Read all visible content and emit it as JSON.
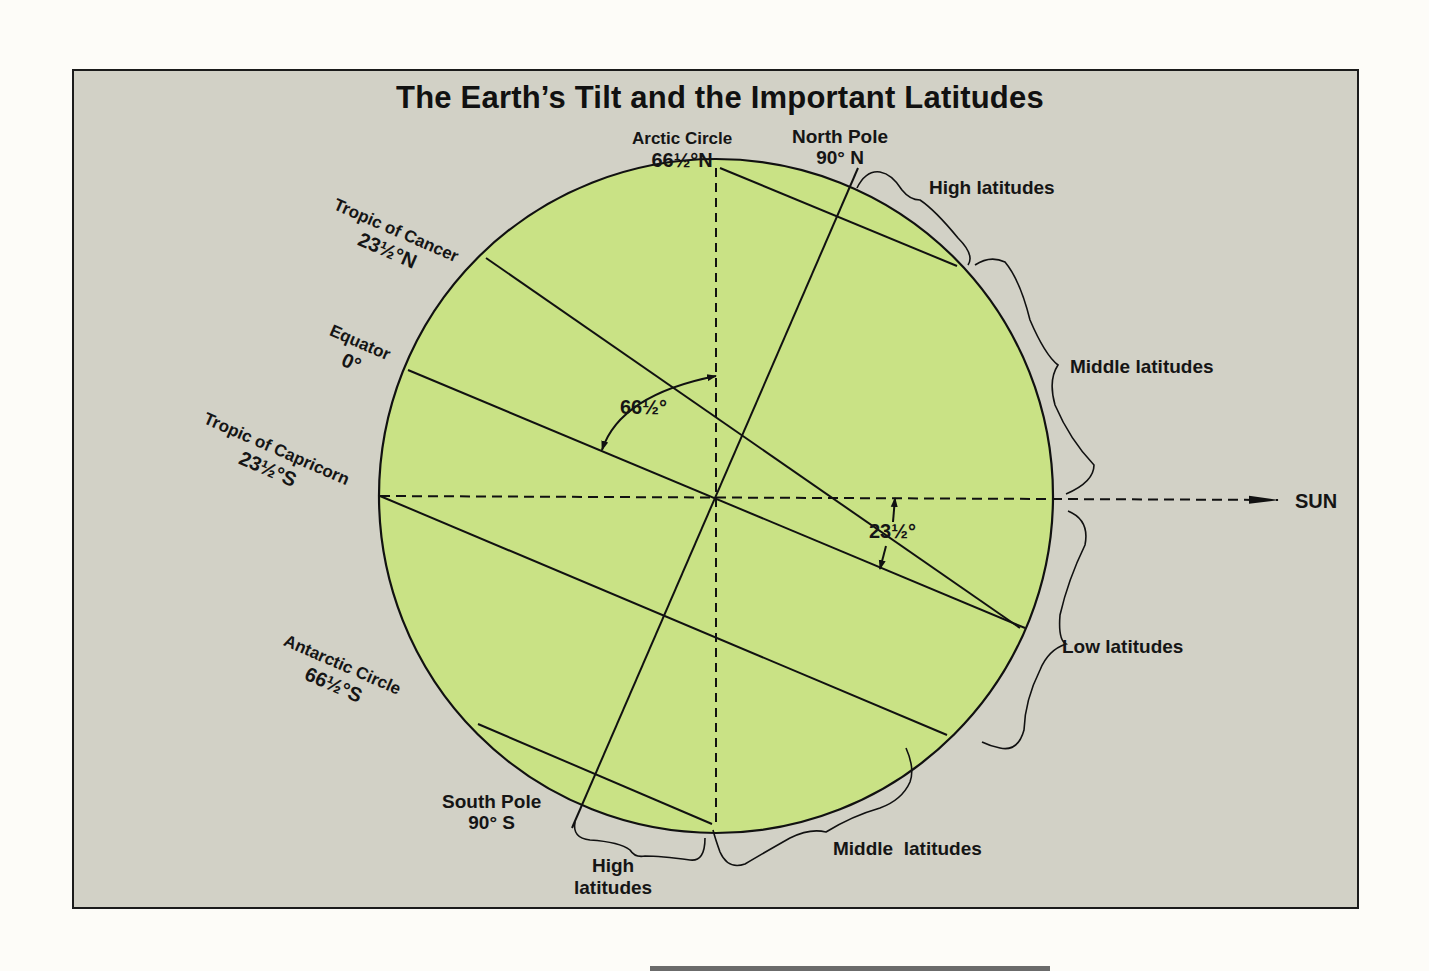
{
  "title": "The Earth’s Tilt and the Important Latitudes",
  "colors": {
    "panel_background": "#d2d1c6",
    "earth_fill": "#c9e285",
    "line": "#111111",
    "page_background": "#fdfcf8"
  },
  "latitude_labels": {
    "arctic_circle": {
      "name": "Arctic Circle",
      "value": "66½°N"
    },
    "north_pole": {
      "name": "North Pole",
      "value": "90° N"
    },
    "tropic_of_cancer": {
      "name": "Tropic of Cancer",
      "value": "23½°N"
    },
    "equator": {
      "name": "Equator",
      "value": "0°"
    },
    "tropic_of_capricorn": {
      "name": "Tropic of Capricorn",
      "value": "23½°S"
    },
    "antarctic_circle": {
      "name": "Antarctic Circle",
      "value": "66½°S"
    },
    "south_pole": {
      "name": "South Pole",
      "value": "90° S"
    }
  },
  "zone_labels": {
    "high_north": "High latitudes",
    "middle_north": "Middle latitudes",
    "low": "Low latitudes",
    "middle_south": "Middle  latitudes",
    "high_south_line1": "High",
    "high_south_line2": "latitudes"
  },
  "angle_labels": {
    "axis_angle": "66½°",
    "tilt_angle": "23½°"
  },
  "sun_label": "SUN",
  "geometry": {
    "center": [
      716,
      496
    ],
    "radius": 337,
    "tilt_degrees": 23.5
  }
}
